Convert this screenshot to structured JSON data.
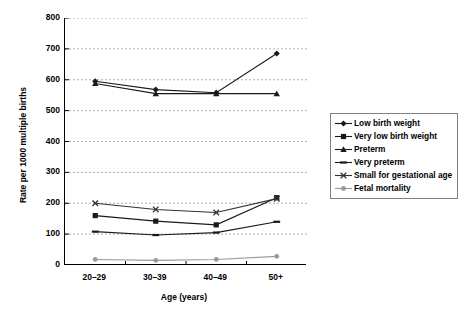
{
  "chart_data": {
    "type": "line",
    "title": "",
    "xlabel": "Age (years)",
    "ylabel": "Rate per 1000 multiple births",
    "categories": [
      "20–29",
      "30–39",
      "40–49",
      "50+"
    ],
    "ylim": [
      0,
      800
    ],
    "yticks": [
      0,
      100,
      200,
      300,
      400,
      500,
      600,
      700,
      800
    ],
    "ytick_labels": [
      "0",
      "100",
      "200",
      "300",
      "400",
      "500",
      "600",
      "700",
      "800"
    ],
    "grid": "horizontal-dashed",
    "legend_position": "right-outside",
    "series": [
      {
        "name": "Low birth weight",
        "marker": "diamond",
        "color": "#1a1a1a",
        "values": [
          595,
          568,
          558,
          685
        ]
      },
      {
        "name": "Very low birth weight",
        "marker": "square",
        "color": "#1a1a1a",
        "values": [
          160,
          142,
          130,
          218
        ]
      },
      {
        "name": "Preterm",
        "marker": "triangle",
        "color": "#1a1a1a",
        "values": [
          588,
          555,
          555,
          555
        ]
      },
      {
        "name": "Very preterm",
        "marker": "dash",
        "color": "#1a1a1a",
        "values": [
          108,
          97,
          105,
          140
        ]
      },
      {
        "name": "Small for gestational age",
        "marker": "cross",
        "color": "#333333",
        "values": [
          200,
          180,
          170,
          215
        ]
      },
      {
        "name": "Fetal mortality",
        "marker": "circle",
        "color": "#999999",
        "values": [
          18,
          15,
          18,
          28
        ]
      }
    ]
  }
}
